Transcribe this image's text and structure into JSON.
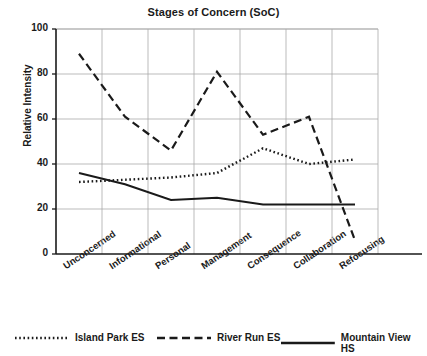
{
  "chart_data": {
    "type": "line",
    "title": "Stages of Concern (SoC)",
    "xlabel": "",
    "ylabel": "Relative Intensity",
    "categories": [
      "Unconcerned",
      "Informational",
      "Personal",
      "Management",
      "Consequence",
      "Collaboration",
      "Refocusing"
    ],
    "ylim": [
      0,
      100
    ],
    "yticks": [
      0,
      20,
      40,
      60,
      80,
      100
    ],
    "grid": true,
    "legend_position": "bottom",
    "series": [
      {
        "name": "Island Park ES",
        "style": "dotted",
        "color": "#1a1a1a",
        "values": [
          32,
          33,
          34,
          36,
          47,
          40,
          42
        ]
      },
      {
        "name": "River Run ES",
        "style": "dashed",
        "color": "#1a1a1a",
        "values": [
          89,
          61,
          46,
          81,
          53,
          61,
          6
        ]
      },
      {
        "name": "Mountain View HS",
        "style": "solid",
        "color": "#1a1a1a",
        "values": [
          36,
          31,
          24,
          25,
          22,
          22,
          22
        ]
      }
    ]
  }
}
